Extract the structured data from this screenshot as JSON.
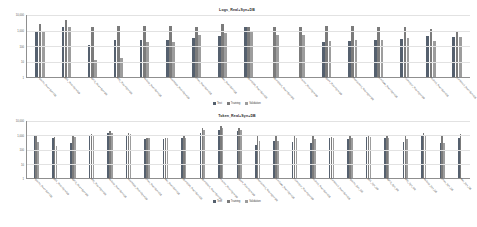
{
  "chart_data": [
    {
      "type": "bar",
      "title": "Logs_Real+Syn+DB",
      "xlabel": "",
      "ylabel": "",
      "yscale": "log",
      "ylim": [
        1,
        10000
      ],
      "yticks": [
        "10,000",
        "1,000",
        "100",
        "10",
        "1"
      ],
      "grid": true,
      "legend_position": "bottom",
      "legend": [
        "Test",
        "Training",
        "Validation"
      ],
      "colors": [
        "#55606e",
        "#7b7b7b",
        "#9d9d9d"
      ],
      "categories": [
        "Apache_Real+Syn+DB",
        "BGL_Real+Syn+DB",
        "HDFS_Real+Syn+DB",
        "HPC_Real+Syn+DB",
        "Hadoop_Real+Syn+DB",
        "HealthApp_Real+Syn+DB",
        "Linux_Real+Syn+DB",
        "Mac_Real+Syn+DB",
        "OpenSSH_Real+Syn+DB",
        "OpenStack_Real+Syn+DB",
        "Proxifier_Real+Syn+DB",
        "Spark_Real+Syn+DB",
        "Thunderbird_Real+Syn+DB",
        "Windows_Real+Syn+DB",
        "Zookeeper_Real+Syn+DB",
        "Android_Real+Syn+DB",
        "Combined_Real+Syn+DB"
      ],
      "series": [
        {
          "name": "Test",
          "values": [
            1000,
            1800,
            120,
            230,
            230,
            260,
            330,
            430,
            1800,
            0,
            0,
            190,
            210,
            260,
            290,
            450,
            400
          ]
        },
        {
          "name": "Training",
          "values": [
            2700,
            4600,
            1700,
            1900,
            2000,
            2000,
            1700,
            2700,
            1800,
            1700,
            1700,
            1900,
            2000,
            1800,
            1700,
            1200,
            900
          ]
        },
        {
          "name": "Validation",
          "values": [
            1000,
            1800,
            13,
            17,
            170,
            185,
            520,
            650,
            1000,
            520,
            520,
            220,
            250,
            250,
            330,
            220,
            400
          ]
        }
      ]
    },
    {
      "type": "bar",
      "title": "Token_Real+Syn+DB",
      "xlabel": "",
      "ylabel": "",
      "yscale": "log",
      "ylim": [
        1,
        10000
      ],
      "yticks": [
        "10,000",
        "1,000",
        "100",
        "10",
        "1"
      ],
      "grid": true,
      "legend_position": "bottom",
      "legend": [
        "Test",
        "Training",
        "Validation"
      ],
      "colors": [
        "#55606e",
        "#7b7b7b",
        "#9d9d9d"
      ],
      "categories": [
        "Apache_Real+Syn+DB",
        "BGL_Real+Syn+DB",
        "HDFS_Real+Syn+DB",
        "HPC_Real+Syn+DB",
        "Hadoop_Real+Syn+DB",
        "HealthApp_Real+Syn+DB",
        "Linux_Real+Syn+DB",
        "Mac_Real+Syn+DB",
        "OpenSSH_Real+Syn+DB",
        "OpenStack_Real+Syn+DB",
        "Proxifier_Real+Syn+DB",
        "Spark_Real+Syn+DB",
        "Thunderbird_Real+Syn+DB",
        "Windows_Real+Syn+DB",
        "Zookeeper_Real+Syn+DB",
        "Android_Real+Syn+DB",
        "Combined_Real+Syn+DB",
        "Apache_Syn_DB",
        "BGL_Syn_DB",
        "HDFS_Syn_DB",
        "HPC_Syn_DB",
        "Hadoop_Syn_DB",
        "Linux_Syn_DB",
        "Mac_Syn_DB"
      ],
      "series": [
        {
          "name": "Test",
          "values": [
            900,
            620,
            300,
            950,
            1400,
            1100,
            560,
            540,
            600,
            1500,
            2300,
            2000,
            200,
            400,
            330,
            280,
            640,
            520,
            740,
            620,
            360,
            950,
            280,
            600
          ]
        },
        {
          "name": "Training",
          "values": [
            1000,
            760,
            820,
            1300,
            1900,
            1500,
            600,
            620,
            900,
            3200,
            4200,
            3000,
            900,
            1000,
            1000,
            950,
            720,
            1000,
            1100,
            1000,
            1000,
            1400,
            1000,
            1300
          ]
        },
        {
          "name": "Validation",
          "values": [
            330,
            180,
            760,
            1000,
            1500,
            1250,
            600,
            620,
            650,
            2400,
            3000,
            2200,
            380,
            380,
            600,
            520,
            680,
            600,
            780,
            620,
            560,
            1000,
            300,
            0
          ]
        }
      ]
    }
  ]
}
